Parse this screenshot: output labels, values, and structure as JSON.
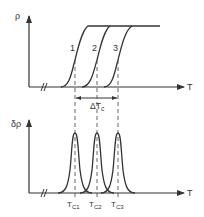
{
  "top_panel": {
    "y_label": "ρ",
    "x_label": "T",
    "curve_labels": [
      "1",
      "2",
      "3"
    ],
    "delta_label": "ΔT",
    "delta_sub": "c"
  },
  "bottom_panel": {
    "y_label": "δρ",
    "x_label": "T",
    "peak_labels": [
      {
        "main": "T",
        "sub": "C1"
      },
      {
        "main": "T",
        "sub": "C2"
      },
      {
        "main": "T",
        "sub": "C3"
      }
    ]
  },
  "colors": {
    "line": "#333333",
    "dash": "#555555",
    "background": "#ffffff"
  }
}
